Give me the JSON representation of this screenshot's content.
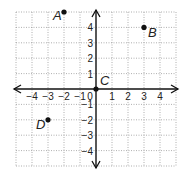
{
  "grid": {
    "xmin": -5,
    "xmax": 5,
    "ymin": -5,
    "ymax": 5,
    "origin_px": [
      96,
      89
    ],
    "unit_x_px": 16,
    "unit_y_px": 15.4,
    "grid_color": "#9a9a9a",
    "axis_color": "#111111"
  },
  "axes": {
    "x_ticks": [
      {
        "value": -4,
        "label": "−4"
      },
      {
        "value": -3,
        "label": "−3"
      },
      {
        "value": -2,
        "label": "−2"
      },
      {
        "value": -1,
        "label": "−1"
      },
      {
        "value": 0,
        "label": "0"
      },
      {
        "value": 1,
        "label": "1"
      },
      {
        "value": 2,
        "label": "2"
      },
      {
        "value": 3,
        "label": "3"
      },
      {
        "value": 4,
        "label": "4"
      }
    ],
    "y_ticks": [
      {
        "value": 4,
        "label": "4"
      },
      {
        "value": 3,
        "label": "3"
      },
      {
        "value": 2,
        "label": "2"
      },
      {
        "value": 1,
        "label": "1"
      },
      {
        "value": -1,
        "label": "−1"
      },
      {
        "value": -2,
        "label": "−2"
      },
      {
        "value": -3,
        "label": "−3"
      },
      {
        "value": -4,
        "label": "−4"
      }
    ]
  },
  "points": [
    {
      "label": "A",
      "x": -2,
      "y": 5,
      "label_dx": -11,
      "label_dy": 8
    },
    {
      "label": "B",
      "x": 3,
      "y": 4,
      "label_dx": 4,
      "label_dy": 10
    },
    {
      "label": "C",
      "x": 0,
      "y": 0,
      "label_dx": 4,
      "label_dy": -4
    },
    {
      "label": "D",
      "x": -3,
      "y": -2,
      "label_dx": -12,
      "label_dy": 9
    }
  ]
}
